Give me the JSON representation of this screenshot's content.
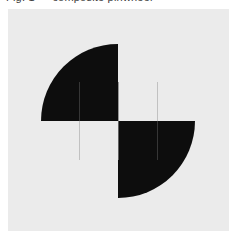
{
  "page": {
    "clipped_header_text": "Fig. 1 — composite pinwheel",
    "background_color": "#ffffff"
  },
  "panel": {
    "name": "figure-panel",
    "background_color": "#ebebeb",
    "x": 8,
    "y": 9,
    "width": 221,
    "height": 222
  },
  "figure": {
    "name": "checkerboard-circle-inversion",
    "ink_color": "#0d0d0d",
    "paper_color": "#ebebeb",
    "center": {
      "x": 110,
      "y": 112
    },
    "checkerboard": {
      "cell_size": 39,
      "left": 72,
      "top": 73,
      "right": 149,
      "bottom": 151,
      "cells": [
        {
          "name": "cell-top-left",
          "row": 0,
          "col": 0,
          "base_fill": "paper"
        },
        {
          "name": "cell-top-right",
          "row": 0,
          "col": 1,
          "base_fill": "ink"
        },
        {
          "name": "cell-bottom-left",
          "row": 1,
          "col": 0,
          "base_fill": "ink"
        },
        {
          "name": "cell-bottom-right",
          "row": 1,
          "col": 1,
          "base_fill": "paper"
        }
      ]
    },
    "circle": {
      "name": "inversion-circle",
      "center_x": 110,
      "center_y": 112,
      "radius": 77,
      "stroke": "none",
      "fill_rule": "invert-quadrants"
    },
    "quadrants": [
      {
        "name": "quadrant-upper-left",
        "inside_circle_fill": "ink",
        "outside_circle_fill": "paper"
      },
      {
        "name": "quadrant-upper-right",
        "inside_circle_fill": "paper",
        "outside_circle_fill": "ink"
      },
      {
        "name": "quadrant-lower-left",
        "inside_circle_fill": "paper",
        "outside_circle_fill": "ink"
      },
      {
        "name": "quadrant-lower-right",
        "inside_circle_fill": "ink",
        "outside_circle_fill": "paper"
      }
    ]
  }
}
